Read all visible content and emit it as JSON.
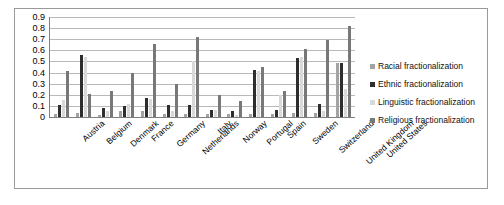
{
  "chart_data": {
    "type": "bar",
    "title": "",
    "xlabel": "",
    "ylabel": "",
    "ylim": [
      0,
      0.9
    ],
    "grid": true,
    "legend_position": "right",
    "yticks": [
      "0.9",
      "0.8",
      "0.7",
      "0.6",
      "0.5",
      "0.4",
      "0.3",
      "0.2",
      "0.1",
      "0"
    ],
    "ytick_values": [
      0.9,
      0.8,
      0.7,
      0.6,
      0.5,
      0.4,
      0.3,
      0.2,
      0.1,
      0
    ],
    "categories": [
      "Austria",
      "Belgium",
      "Denmark",
      "France",
      "Germany",
      "Netherlands",
      "Italy",
      "Norway",
      "Portugal",
      "Spain",
      "Sweden",
      "Switzerland",
      "United Kingdom",
      "United States"
    ],
    "series": [
      {
        "name": "Racial fractionalization",
        "color": "#a3a3a3",
        "values": [
          0.03,
          0.04,
          0.02,
          0.05,
          0.05,
          0.03,
          0.03,
          0.03,
          0.03,
          0.03,
          0.03,
          0.04,
          0.04,
          0.49
        ]
      },
      {
        "name": "Ethnic fractionalization",
        "color": "#2e2e2e",
        "values": [
          0.11,
          0.56,
          0.08,
          0.1,
          0.17,
          0.11,
          0.11,
          0.06,
          0.05,
          0.42,
          0.06,
          0.53,
          0.12,
          0.49
        ]
      },
      {
        "name": "Linguistic fractionalization",
        "color": "#d9d9d9",
        "values": [
          0.15,
          0.54,
          0.05,
          0.12,
          0.16,
          0.05,
          0.5,
          0.06,
          0.02,
          0.41,
          0.2,
          0.54,
          0.05,
          0.25
        ]
      },
      {
        "name": "Religious fractionalization",
        "color": "#787878",
        "values": [
          0.41,
          0.21,
          0.23,
          0.4,
          0.66,
          0.3,
          0.72,
          0.2,
          0.14,
          0.45,
          0.23,
          0.61,
          0.69,
          0.82
        ]
      }
    ]
  },
  "legend": {
    "items": [
      {
        "label": "Racial fractionalization",
        "color": "#a3a3a3"
      },
      {
        "label": "Ethnic fractionalization",
        "color": "#2e2e2e"
      },
      {
        "label": "Linguistic fractionalization",
        "color": "#d9d9d9"
      },
      {
        "label": "Religious fractionalization",
        "color": "#787878"
      }
    ]
  }
}
